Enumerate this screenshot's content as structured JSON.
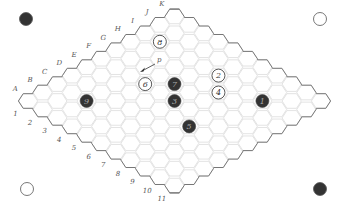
{
  "board": {
    "size": 11,
    "origin": [
      28,
      101
    ],
    "step_x": 14.65,
    "step_y": 8.46,
    "hex_radius": 9.6,
    "grid_color": "#dcdcdc",
    "edge_color": "#777777",
    "letters": [
      "A",
      "B",
      "C",
      "D",
      "E",
      "F",
      "G",
      "H",
      "I",
      "J",
      "K"
    ],
    "numbers": [
      "1",
      "2",
      "3",
      "4",
      "5",
      "6",
      "7",
      "8",
      "9",
      "10",
      "11"
    ]
  },
  "corners": [
    {
      "name": "corner-top-left",
      "x": 26,
      "y": 19,
      "color": "black"
    },
    {
      "name": "corner-top-right",
      "x": 320,
      "y": 19,
      "color": "white"
    },
    {
      "name": "corner-bottom-left",
      "x": 27,
      "y": 189,
      "color": "white"
    },
    {
      "name": "corner-bottom-right",
      "x": 320,
      "y": 189,
      "color": "black"
    }
  ],
  "stones": [
    {
      "move": "1",
      "cell": "I9",
      "i": 8,
      "j": 8,
      "color": "black"
    },
    {
      "move": "2",
      "cell": "I6",
      "i": 8,
      "j": 5,
      "color": "white"
    },
    {
      "move": "3",
      "cell": "F6",
      "i": 5,
      "j": 5,
      "color": "black"
    },
    {
      "move": "4",
      "cell": "H7",
      "i": 7,
      "j": 6,
      "color": "white"
    },
    {
      "move": "5",
      "cell": "E8",
      "i": 4,
      "j": 7,
      "color": "black"
    },
    {
      "move": "6",
      "cell": "F4",
      "i": 5,
      "j": 3,
      "color": "white"
    },
    {
      "move": "7",
      "cell": "G5",
      "i": 6,
      "j": 4,
      "color": "black"
    },
    {
      "move": "8",
      "cell": "I2",
      "i": 8,
      "j": 1,
      "color": "white"
    },
    {
      "move": "9",
      "cell": "C3",
      "i": 2,
      "j": 2,
      "color": "black"
    }
  ],
  "annotation": {
    "label": "p",
    "from": [
      155,
      64
    ],
    "to": [
      140,
      72
    ],
    "label_pos": [
      157,
      62
    ]
  }
}
